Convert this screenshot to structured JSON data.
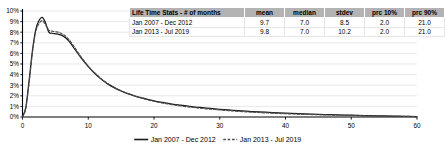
{
  "chart_data": {
    "type": "line",
    "title": "",
    "xlabel": "",
    "ylabel": "",
    "xlim": [
      0,
      60
    ],
    "ylim": [
      0,
      0.1
    ],
    "grid": true,
    "legend_position": "bottom",
    "xticks": [
      "0",
      "10",
      "20",
      "30",
      "40",
      "50",
      "60"
    ],
    "xtick_values": [
      0,
      10,
      20,
      30,
      40,
      50,
      60
    ],
    "yticks": [
      "0%",
      "1%",
      "2%",
      "3%",
      "4%",
      "5%",
      "6%",
      "7%",
      "8%",
      "9%",
      "10%"
    ],
    "ytick_values": [
      0,
      1,
      2,
      3,
      4,
      5,
      6,
      7,
      8,
      9,
      10
    ],
    "x": [
      0,
      0.5,
      1,
      1.5,
      2,
      2.5,
      3,
      3.5,
      4,
      4.5,
      5,
      5.5,
      6,
      6.5,
      7,
      7.5,
      8,
      9,
      10,
      11,
      12,
      13,
      14,
      15,
      16,
      17,
      18,
      19,
      20,
      21,
      22,
      23,
      24,
      25,
      26,
      27,
      28,
      29,
      30,
      32,
      34,
      36,
      38,
      40,
      42,
      44,
      46,
      48,
      50,
      52,
      54,
      56,
      58,
      60
    ],
    "series": [
      {
        "name": "Jan 2007 - Dec 2012",
        "style": "solid",
        "color": "#1a1a1a",
        "values": [
          0.0,
          0.9,
          3.4,
          6.2,
          8.2,
          9.1,
          9.4,
          8.9,
          8.0,
          7.9,
          7.85,
          7.8,
          7.7,
          7.5,
          7.2,
          6.8,
          6.35,
          5.5,
          4.75,
          4.1,
          3.55,
          3.1,
          2.75,
          2.45,
          2.2,
          2.0,
          1.82,
          1.66,
          1.52,
          1.4,
          1.3,
          1.2,
          1.12,
          1.04,
          0.96,
          0.9,
          0.84,
          0.78,
          0.73,
          0.63,
          0.55,
          0.48,
          0.42,
          0.36,
          0.31,
          0.27,
          0.23,
          0.2,
          0.17,
          0.14,
          0.11,
          0.09,
          0.06,
          0.04
        ]
      },
      {
        "name": "Jan 2013 - Jul 2019",
        "style": "dashed",
        "color": "#4d4d4d",
        "values": [
          0.0,
          0.8,
          3.2,
          6.0,
          8.0,
          8.8,
          9.1,
          8.7,
          8.2,
          8.1,
          8.05,
          8.0,
          7.85,
          7.65,
          7.35,
          6.95,
          6.5,
          5.6,
          4.8,
          4.15,
          3.6,
          3.15,
          2.78,
          2.48,
          2.22,
          2.0,
          1.8,
          1.63,
          1.48,
          1.35,
          1.24,
          1.14,
          1.05,
          0.97,
          0.9,
          0.83,
          0.77,
          0.72,
          0.67,
          0.57,
          0.49,
          0.42,
          0.36,
          0.31,
          0.27,
          0.23,
          0.2,
          0.17,
          0.15,
          0.12,
          0.1,
          0.08,
          0.06,
          0.04
        ]
      }
    ],
    "legend": [
      {
        "label": "Jan 2007 - Dec 2012",
        "style": "solid"
      },
      {
        "label": "Jan 2013 - Jul 2019",
        "style": "dashed"
      }
    ]
  },
  "stats_table": {
    "headers": [
      "Life Time Stats - # of months",
      "mean",
      "median",
      "stdev",
      "prc 10%",
      "prc 90%"
    ],
    "rows": [
      {
        "label": "Jan 2007 - Dec 2012",
        "mean": "9.7",
        "median": "7.0",
        "stdev": "8.5",
        "prc10": "2.0",
        "prc90": "21.0"
      },
      {
        "label": "Jan 2013 - Jul 2019",
        "mean": "9.8",
        "median": "7.0",
        "stdev": "10.2",
        "prc10": "2.0",
        "prc90": "21.0"
      }
    ]
  },
  "colors": {
    "series1": "#1a1a1a",
    "series2": "#4d4d4d",
    "gridline": "#d9d9d9",
    "axis": "#000000",
    "header_bg": "#b3b3b3"
  }
}
